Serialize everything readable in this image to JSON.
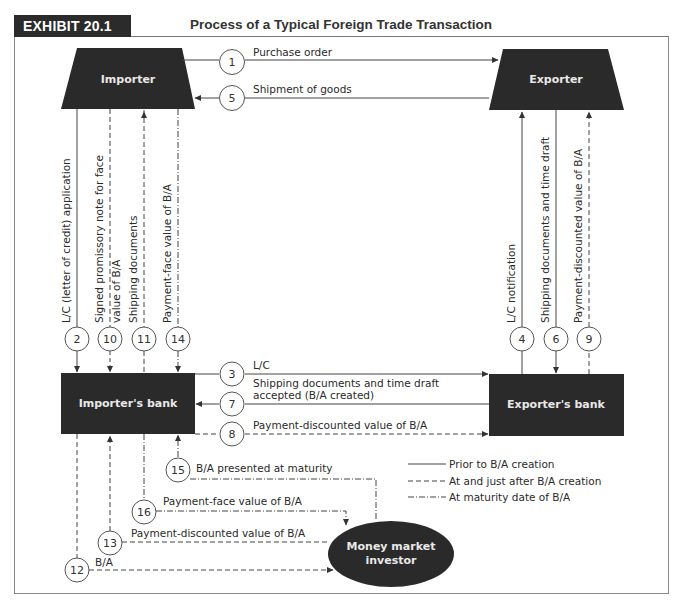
{
  "header": {
    "exhibit_label": "EXHIBIT 20.1",
    "title": "Process of a Typical Foreign Trade Transaction"
  },
  "nodes": {
    "importer": "Importer",
    "exporter": "Exporter",
    "importers_bank": "Importer's bank",
    "exporters_bank": "Exporter's bank",
    "investor_line1": "Money market",
    "investor_line2": "investor"
  },
  "steps": {
    "s1": {
      "num": "1",
      "label": "Purchase order",
      "style": "solid"
    },
    "s2": {
      "num": "2",
      "label": "L/C (letter of credit) application",
      "style": "solid"
    },
    "s3": {
      "num": "3",
      "label": "L/C",
      "style": "solid"
    },
    "s4": {
      "num": "4",
      "label": "L/C notification",
      "style": "solid"
    },
    "s5": {
      "num": "5",
      "label": "Shipment of goods",
      "style": "solid"
    },
    "s6": {
      "num": "6",
      "label": "Shipping documents and time draft",
      "style": "solid"
    },
    "s7": {
      "num": "7",
      "label_line1": "Shipping documents and time draft",
      "label_line2": "accepted (B/A created)",
      "style": "solid"
    },
    "s8": {
      "num": "8",
      "label": "Payment-discounted value of B/A",
      "style": "dashed"
    },
    "s9": {
      "num": "9",
      "label": "Payment-discounted value of B/A",
      "style": "dashed"
    },
    "s10": {
      "num": "10",
      "label_line1": "Signed promissory note for face",
      "label_line2": "value of B/A",
      "style": "dashed"
    },
    "s11": {
      "num": "11",
      "label": "Shipping documents",
      "style": "dashed"
    },
    "s12": {
      "num": "12",
      "label": "B/A",
      "style": "dashed"
    },
    "s13": {
      "num": "13",
      "label": "Payment-discounted value of B/A",
      "style": "dashed"
    },
    "s14": {
      "num": "14",
      "label": "Payment-face value of B/A",
      "style": "dashdot"
    },
    "s15": {
      "num": "15",
      "label": "B/A presented at maturity",
      "style": "dashdot"
    },
    "s16": {
      "num": "16",
      "label": "Payment-face value of B/A",
      "style": "dashdot"
    }
  },
  "legend": {
    "solid": "Prior to B/A creation",
    "dashed": "At and just after B/A creation",
    "dashdot": "At maturity date of B/A"
  },
  "colors": {
    "node_fill": "#2a2a2a",
    "line": "#444444",
    "header_bg": "#2b2b2b"
  }
}
